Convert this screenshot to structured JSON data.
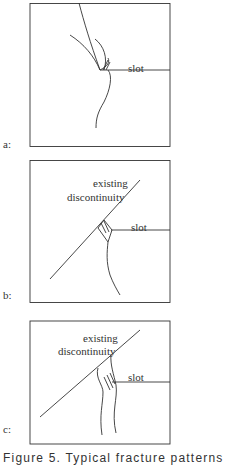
{
  "panels": [
    {
      "id": "a",
      "label": "a:",
      "annotations": {
        "slot": "slot"
      }
    },
    {
      "id": "b",
      "label": "b:",
      "annotations": {
        "slot": "slot",
        "discontinuity_line1": "existing",
        "discontinuity_line2": "discontinuity"
      }
    },
    {
      "id": "c",
      "label": "c:",
      "annotations": {
        "slot": "slot",
        "discontinuity_line1": "existing",
        "discontinuity_line2": "discontinuity"
      }
    }
  ],
  "caption": "Figure 5. Typical fracture patterns"
}
